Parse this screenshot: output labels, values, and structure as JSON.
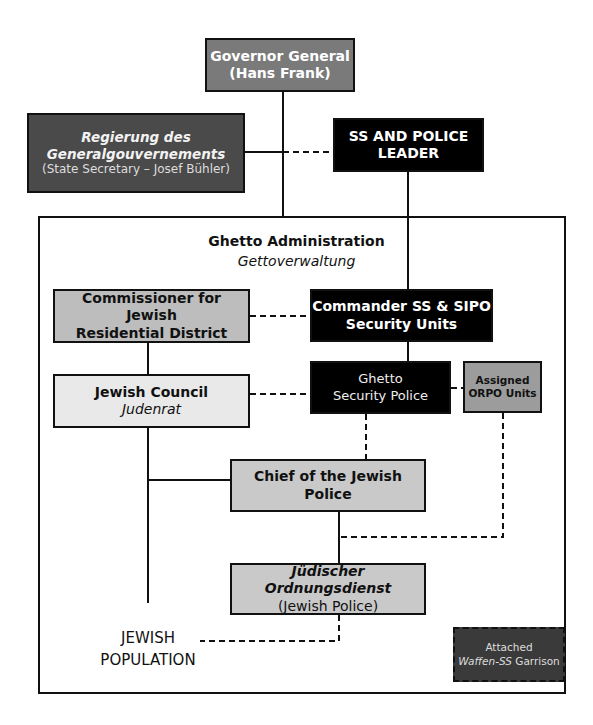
{
  "header_fragment": "…y…",
  "nodes": {
    "governor_general": {
      "line1": "Governor General",
      "line2": "(Hans Frank)",
      "color": "#7a7a7a"
    },
    "regierung": {
      "line1": "Regierung des",
      "line2": "Generalgouvernements",
      "line3": "(State Secretary – Josef Bühler)",
      "color": "#4a4a4a"
    },
    "ss_police_leader": {
      "line1": "SS AND POLICE",
      "line2": "LEADER",
      "color": "#000000"
    },
    "ghetto_admin": {
      "title": "Ghetto Administration",
      "subtitle": "Gettoverwaltung"
    },
    "commissioner": {
      "line1": "Commissioner for Jewish",
      "line2": "Residential District",
      "color": "#bdbdbd"
    },
    "commander_ss": {
      "line1": "Commander SS & SIPO",
      "line2": "Security Units",
      "color": "#000000"
    },
    "jewish_council": {
      "line1": "Jewish Council",
      "line2": "Judenrat",
      "color": "#e9e9e9"
    },
    "ghetto_security_police": {
      "line1": "Ghetto",
      "line2": "Security Police",
      "color": "#000000"
    },
    "orpo_units": {
      "line1": "Assigned",
      "line2": "ORPO Units",
      "color": "#9c9c9c"
    },
    "chief_jewish_police": {
      "line1": "Chief of the Jewish Police",
      "color": "#c9c9c9"
    },
    "ordnungsdienst": {
      "line1": "Jüdischer Ordnungsdienst",
      "line2": "(Jewish Police)",
      "color": "#c9c9c9"
    },
    "jewish_population": {
      "line1": "JEWISH",
      "line2": "POPULATION"
    },
    "waffen_ss": {
      "line1": "Attached",
      "line2_italic": "Waffen-SS",
      "line2_rest": " Garrison",
      "color": "#3a3a3a"
    }
  }
}
